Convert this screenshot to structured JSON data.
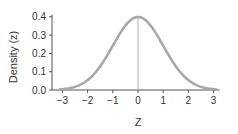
{
  "chart_data": {
    "type": "line",
    "title": "",
    "xlabel": "Z",
    "ylabel": "Density (z)",
    "xlim": [
      -3,
      3
    ],
    "ylim": [
      0,
      0.4
    ],
    "x_ticks": [
      -3,
      -2,
      -1,
      0,
      1,
      2,
      3
    ],
    "x_tick_labels": [
      "−3",
      "−2",
      "−1",
      "0",
      "1",
      "2",
      "3"
    ],
    "y_ticks": [
      0.0,
      0.1,
      0.2,
      0.3,
      0.4
    ],
    "y_tick_labels": [
      "0.0",
      "0.1",
      "0.2",
      "0.3",
      "0.4"
    ],
    "grid": false,
    "legend": null,
    "annotations": [
      "vertical reference line at z = 0"
    ],
    "series": [
      {
        "name": "Standard normal density",
        "x": [
          -3,
          -2.5,
          -2,
          -1.5,
          -1,
          -0.5,
          0,
          0.5,
          1,
          1.5,
          2,
          2.5,
          3
        ],
        "values": [
          0.004,
          0.018,
          0.054,
          0.13,
          0.242,
          0.352,
          0.399,
          0.352,
          0.242,
          0.13,
          0.054,
          0.018,
          0.004
        ]
      }
    ],
    "colors": {
      "curve": "#a8a8a8",
      "axis": "#555555",
      "reference_line": "#b0b0b0"
    }
  }
}
